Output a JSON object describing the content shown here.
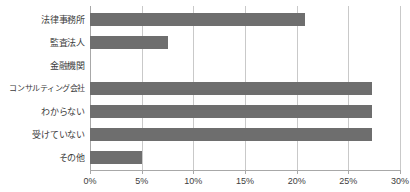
{
  "chart_data": {
    "type": "bar",
    "orientation": "horizontal",
    "title": "",
    "subtitle": "",
    "xlabel": "",
    "ylabel": "",
    "categories": [
      "法律事務所",
      "監査法人",
      "金融機関",
      "コンサルティング会社",
      "わからない",
      "受けていない",
      "その他"
    ],
    "values": [
      20.8,
      7.5,
      0.0,
      27.3,
      27.3,
      27.3,
      5.0
    ],
    "value_unit": "%",
    "xlim": [
      0,
      30
    ],
    "xticks": [
      0,
      5,
      10,
      15,
      20,
      25,
      30
    ],
    "xtick_labels": [
      "0%",
      "5%",
      "10%",
      "15%",
      "20%",
      "25%",
      "30%"
    ],
    "grid": "vertical",
    "legend": "none",
    "series": [
      {
        "name": "割合",
        "values": [
          20.8,
          7.5,
          0.0,
          27.3,
          27.3,
          27.3,
          5.0
        ]
      }
    ],
    "colors": {
      "bar": "#6e6e6e",
      "gridline": "#c9c9c9",
      "axis": "#a8a8a8",
      "text": "#3d3d3d",
      "background": "#ffffff"
    }
  }
}
